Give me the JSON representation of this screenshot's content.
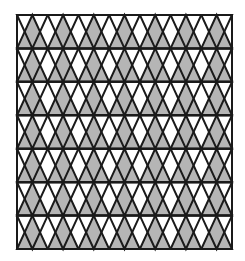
{
  "figure": {
    "shape_name": "triangle-tessellation",
    "background_color": "#ffffff"
  },
  "frame": {
    "name": "outer-square-frame",
    "x": 17,
    "y": 15,
    "width": 215,
    "height": 234,
    "stroke_color": "#1a1a1a",
    "stroke_width": 2,
    "fill_color": "#ffffff"
  },
  "style": {
    "shaded_fill": "#b5b5b5",
    "unshaded_fill": "#ffffff",
    "triangle_stroke": "#1a1a1a",
    "triangle_stroke_width": 2,
    "band_divider_color": "#1a1a1a",
    "band_divider_width": 2
  },
  "pattern": {
    "band_count": 7,
    "band_height": 33.43,
    "triangles_per_band": 7,
    "triangle_base_width": 30.71,
    "shaded_orientation": "up",
    "unshaded_orientation": "down",
    "row_offset_alternating": false
  },
  "bands": [
    {
      "index": 1,
      "label": "band-1",
      "y_top": 15.0,
      "y_bottom": 48.43,
      "shaded_count": 7,
      "unshaded_count": 7
    },
    {
      "index": 2,
      "label": "band-2",
      "y_top": 48.43,
      "y_bottom": 81.86,
      "shaded_count": 7,
      "unshaded_count": 7
    },
    {
      "index": 3,
      "label": "band-3",
      "y_top": 81.86,
      "y_bottom": 115.29,
      "shaded_count": 7,
      "unshaded_count": 7
    },
    {
      "index": 4,
      "label": "band-4",
      "y_top": 115.29,
      "y_bottom": 148.71,
      "shaded_count": 7,
      "unshaded_count": 7
    },
    {
      "index": 5,
      "label": "band-5",
      "y_top": 148.71,
      "y_bottom": 182.14,
      "shaded_count": 7,
      "unshaded_count": 7
    },
    {
      "index": 6,
      "label": "band-6",
      "y_top": 182.14,
      "y_bottom": 215.57,
      "shaded_count": 7,
      "unshaded_count": 7
    },
    {
      "index": 7,
      "label": "band-7",
      "y_top": 215.57,
      "y_bottom": 249.0,
      "shaded_count": 7,
      "unshaded_count": 7
    }
  ],
  "counts": {
    "total_shaded_triangles": 49,
    "total_unshaded_triangles": 49,
    "total_triangles": 98
  }
}
